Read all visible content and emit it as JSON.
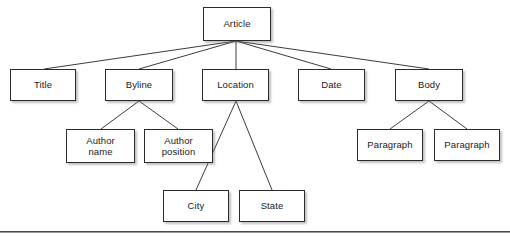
{
  "diagram": {
    "type": "tree",
    "background_color": "#ffffff",
    "box_border_color": "#2b2b2b",
    "box_fill_color": "#ffffff",
    "edge_color": "#3c3c3c",
    "text_color": "#1a1a1a",
    "rule_color": "#4a4a4a",
    "nodes": [
      {
        "id": "article",
        "label": "Article",
        "x": 203,
        "y": 7,
        "w": 68,
        "h": 34,
        "level": 0,
        "parent": null
      },
      {
        "id": "title",
        "label": "Title",
        "x": 10,
        "y": 69,
        "w": 66,
        "h": 32,
        "level": 1,
        "parent": "article"
      },
      {
        "id": "byline",
        "label": "Byline",
        "x": 105,
        "y": 69,
        "w": 68,
        "h": 32,
        "level": 1,
        "parent": "article"
      },
      {
        "id": "location",
        "label": "Location",
        "x": 202,
        "y": 69,
        "w": 67,
        "h": 32,
        "level": 1,
        "parent": "article"
      },
      {
        "id": "date",
        "label": "Date",
        "x": 298,
        "y": 69,
        "w": 67,
        "h": 32,
        "level": 1,
        "parent": "article"
      },
      {
        "id": "body",
        "label": "Body",
        "x": 395,
        "y": 69,
        "w": 68,
        "h": 32,
        "level": 1,
        "parent": "article"
      },
      {
        "id": "author-name",
        "label": "Author\nname",
        "x": 66,
        "y": 129,
        "w": 69,
        "h": 34,
        "level": 2,
        "parent": "byline"
      },
      {
        "id": "author-position",
        "label": "Author\nposition",
        "x": 144,
        "y": 129,
        "w": 69,
        "h": 34,
        "level": 2,
        "parent": "byline"
      },
      {
        "id": "paragraph-1",
        "label": "Paragraph",
        "x": 357,
        "y": 129,
        "w": 66,
        "h": 32,
        "level": 2,
        "parent": "body"
      },
      {
        "id": "paragraph-2",
        "label": "Paragraph",
        "x": 434,
        "y": 129,
        "w": 66,
        "h": 32,
        "level": 2,
        "parent": "body"
      },
      {
        "id": "city",
        "label": "City",
        "x": 163,
        "y": 190,
        "w": 66,
        "h": 32,
        "level": 2,
        "parent": "location"
      },
      {
        "id": "state",
        "label": "State",
        "x": 239,
        "y": 190,
        "w": 66,
        "h": 32,
        "level": 2,
        "parent": "location"
      }
    ],
    "edges": [
      {
        "from": "article",
        "to": "title",
        "x1": 236,
        "y1": 41,
        "x2": 44,
        "y2": 69
      },
      {
        "from": "article",
        "to": "byline",
        "x1": 236,
        "y1": 41,
        "x2": 139,
        "y2": 69
      },
      {
        "from": "article",
        "to": "location",
        "x1": 236,
        "y1": 41,
        "x2": 236,
        "y2": 69
      },
      {
        "from": "article",
        "to": "date",
        "x1": 236,
        "y1": 41,
        "x2": 331,
        "y2": 69
      },
      {
        "from": "article",
        "to": "body",
        "x1": 236,
        "y1": 41,
        "x2": 429,
        "y2": 69
      },
      {
        "from": "byline",
        "to": "author-name",
        "x1": 139,
        "y1": 101,
        "x2": 101,
        "y2": 129
      },
      {
        "from": "byline",
        "to": "author-position",
        "x1": 139,
        "y1": 101,
        "x2": 178,
        "y2": 129
      },
      {
        "from": "body",
        "to": "paragraph-1",
        "x1": 429,
        "y1": 101,
        "x2": 390,
        "y2": 129
      },
      {
        "from": "body",
        "to": "paragraph-2",
        "x1": 429,
        "y1": 101,
        "x2": 467,
        "y2": 129
      },
      {
        "from": "location",
        "to": "city",
        "x1": 236,
        "y1": 101,
        "x2": 196,
        "y2": 190
      },
      {
        "from": "location",
        "to": "state",
        "x1": 236,
        "y1": 101,
        "x2": 272,
        "y2": 190
      }
    ],
    "baseline_rule": {
      "x": 0,
      "y": 231,
      "w": 510
    }
  }
}
